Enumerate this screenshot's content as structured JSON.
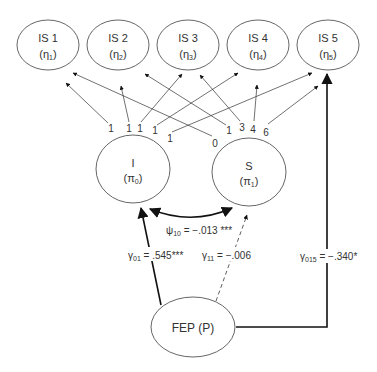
{
  "diagram": {
    "type": "path-model",
    "outcome_nodes": [
      {
        "id": "IS1",
        "label": "IS 1",
        "symbol": "η",
        "sub": "1"
      },
      {
        "id": "IS2",
        "label": "IS 2",
        "symbol": "η",
        "sub": "2"
      },
      {
        "id": "IS3",
        "label": "IS 3",
        "symbol": "η",
        "sub": "3"
      },
      {
        "id": "IS4",
        "label": "IS 4",
        "symbol": "η",
        "sub": "4"
      },
      {
        "id": "IS5",
        "label": "IS 5",
        "symbol": "η",
        "sub": "5"
      }
    ],
    "growth_factors": [
      {
        "id": "I",
        "label": "I",
        "symbol": "π",
        "sub": "0"
      },
      {
        "id": "S",
        "label": "S",
        "symbol": "π",
        "sub": "1"
      }
    ],
    "predictor": {
      "id": "FEP",
      "label": "FEP (P)"
    },
    "intercept_loadings": [
      {
        "to": "IS1",
        "value": "1"
      },
      {
        "to": "IS2",
        "value": "1"
      },
      {
        "to": "IS3",
        "value": "1"
      },
      {
        "to": "IS4",
        "value": "1"
      },
      {
        "to": "IS5",
        "value": "1"
      }
    ],
    "slope_loadings": [
      {
        "to": "IS1",
        "value": "0"
      },
      {
        "to": "IS2",
        "value": "1"
      },
      {
        "to": "IS3",
        "value": "3"
      },
      {
        "to": "IS4",
        "value": "4"
      },
      {
        "to": "IS5",
        "value": "6"
      }
    ],
    "covariance": {
      "symbol": "ψ",
      "sub": "10",
      "text": " = −.013 ***"
    },
    "paths": [
      {
        "from": "FEP",
        "to": "I",
        "symbol": "γ",
        "sub": "01",
        "text": " = .545***",
        "style": "solid"
      },
      {
        "from": "FEP",
        "to": "S",
        "symbol": "γ",
        "sub": "11",
        "text": " = −.006",
        "style": "dashed"
      },
      {
        "from": "FEP",
        "to": "IS5",
        "symbol": "γ",
        "sub": "015",
        "text": " = −.340*",
        "style": "solid"
      }
    ]
  },
  "colors": {
    "line": "#2a2a2a",
    "ellipse_stroke": "#555555",
    "background": "#ffffff"
  }
}
